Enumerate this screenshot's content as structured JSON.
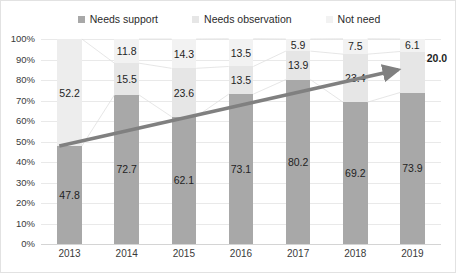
{
  "legend": {
    "items": [
      {
        "label": "Needs support",
        "color": "#a8a8a8",
        "key": "support"
      },
      {
        "label": "Needs observation",
        "color": "#e6e6e6",
        "key": "observation"
      },
      {
        "label": "Not need",
        "color": "#f2f2f2",
        "key": "notneed"
      }
    ]
  },
  "chart_data": {
    "type": "bar",
    "subtype": "stacked-100-percent-column",
    "title": "",
    "xlabel": "",
    "ylabel": "",
    "ylim": [
      0,
      100
    ],
    "ytick_labels": [
      "100%",
      "90%",
      "80%",
      "70%",
      "60%",
      "50%",
      "40%",
      "30%",
      "20%",
      "10%",
      "0%"
    ],
    "ytick_values": [
      100,
      90,
      80,
      70,
      60,
      50,
      40,
      30,
      20,
      10,
      0
    ],
    "grid": true,
    "legend_position": "top-center",
    "categories": [
      "2013",
      "2014",
      "2015",
      "2016",
      "2017",
      "2018",
      "2019"
    ],
    "series": [
      {
        "name": "Needs support",
        "color": "#a8a8a8",
        "values": [
          47.8,
          72.7,
          62.1,
          73.1,
          80.2,
          69.2,
          73.9
        ]
      },
      {
        "name": "Needs observation",
        "color": "#e6e6e6",
        "values": [
          52.2,
          15.5,
          23.6,
          13.5,
          13.9,
          23.4,
          20.0
        ]
      },
      {
        "name": "Not need",
        "color": "#f2f2f2",
        "values": [
          null,
          11.8,
          14.3,
          13.5,
          5.9,
          7.5,
          6.1
        ]
      }
    ],
    "data_labels": {
      "support": [
        "47.8",
        "72.7",
        "62.1",
        "73.1",
        "80.2",
        "69.2",
        "73.9"
      ],
      "observation": [
        "52.2",
        "15.5",
        "23.6",
        "13.5",
        "13.9",
        "23.4",
        "20.0"
      ],
      "notneed": [
        "",
        "11.8",
        "14.3",
        "13.5",
        "5.9",
        "7.5",
        "6.1"
      ]
    },
    "annotations": [
      {
        "type": "arrow",
        "name": "trend-arrow",
        "color": "#808080",
        "from": {
          "category": "2013",
          "value": 47.8
        },
        "to": {
          "category": "2019",
          "value": 85.0
        },
        "emphasized_label": "20.0"
      }
    ]
  }
}
